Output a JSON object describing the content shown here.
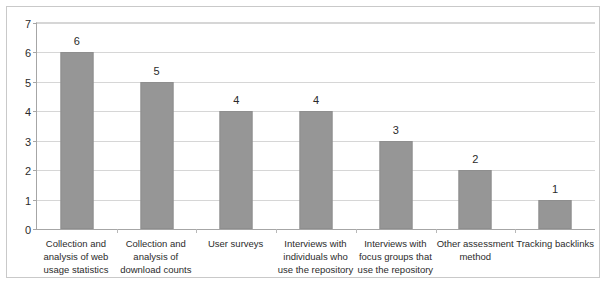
{
  "chart_data": {
    "type": "bar",
    "title": "",
    "subtitle": "",
    "xlabel": "",
    "ylabel": "",
    "ylim": [
      0,
      7
    ],
    "yticks": [
      0,
      1,
      2,
      3,
      4,
      5,
      6,
      7
    ],
    "grid": true,
    "legend": false,
    "legend_position": "none",
    "bar_color": "#969696",
    "categories": [
      "Collection and analysis of web usage statistics",
      "Collection and analysis of download counts",
      "User surveys",
      "Interviews with individuals who use the repository",
      "Interviews with focus groups that use the repository",
      "Other assessment method",
      "Tracking backlinks"
    ],
    "values": [
      6,
      5,
      4,
      4,
      3,
      2,
      1
    ],
    "data_labels": [
      "6",
      "5",
      "4",
      "4",
      "3",
      "2",
      "1"
    ]
  }
}
